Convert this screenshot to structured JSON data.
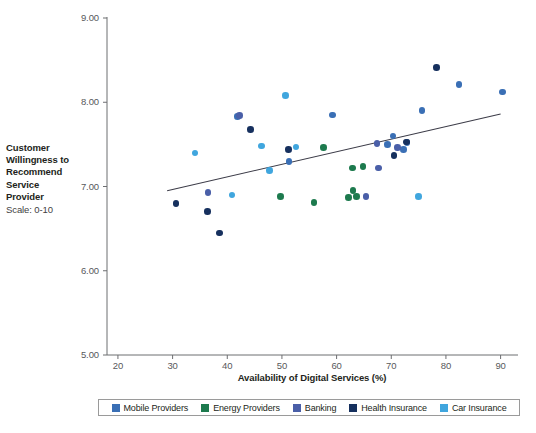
{
  "chart_data": {
    "type": "scatter",
    "title": "",
    "xlabel": "Availability of Digital Services (%)",
    "ylabel": "Customer Willingness to Recommend Service Provider",
    "ylabel_sub": "Scale: 0-10",
    "xlim": [
      18,
      93
    ],
    "ylim": [
      5.0,
      9.0
    ],
    "xticks": [
      20,
      30,
      40,
      50,
      60,
      70,
      80,
      90
    ],
    "xtick_labels": [
      "20",
      "30",
      "40",
      "50",
      "60",
      "70",
      "80",
      "90"
    ],
    "yticks": [
      5.0,
      6.0,
      7.0,
      8.0,
      9.0
    ],
    "ytick_labels": [
      "5.00",
      "6.00",
      "7.00",
      "8.00",
      "9.00"
    ],
    "grid": false,
    "legend_position": "bottom",
    "trendline": {
      "x0": 29.0,
      "y0": 6.95,
      "x1": 90.0,
      "y1": 7.86,
      "color": "#3c3c48"
    },
    "series": [
      {
        "name": "Mobile Providers",
        "color": "#3a6fb5",
        "points": [
          [
            41.9,
            7.83
          ],
          [
            51.3,
            7.3
          ],
          [
            59.3,
            7.85
          ],
          [
            69.3,
            7.5
          ],
          [
            70.3,
            7.6
          ],
          [
            72.2,
            7.44
          ],
          [
            72.9,
            7.52
          ],
          [
            75.6,
            7.9
          ],
          [
            82.4,
            8.21
          ],
          [
            90.3,
            8.12
          ]
        ]
      },
      {
        "name": "Energy Providers",
        "color": "#1d7a4e",
        "points": [
          [
            49.7,
            6.88
          ],
          [
            55.9,
            6.81
          ],
          [
            57.6,
            7.46
          ],
          [
            62.2,
            6.87
          ],
          [
            62.9,
            7.22
          ],
          [
            63.0,
            6.95
          ],
          [
            63.6,
            6.88
          ],
          [
            64.8,
            7.24
          ]
        ]
      },
      {
        "name": "Banking",
        "color": "#4a5fa8",
        "points": [
          [
            36.5,
            6.93
          ],
          [
            42.2,
            7.84
          ],
          [
            65.4,
            6.88
          ],
          [
            67.4,
            7.51
          ],
          [
            67.7,
            7.22
          ],
          [
            71.1,
            7.46
          ]
        ]
      },
      {
        "name": "Health Insurance",
        "color": "#16305e",
        "points": [
          [
            30.6,
            6.8
          ],
          [
            36.4,
            6.7
          ],
          [
            38.6,
            6.45
          ],
          [
            44.2,
            7.68
          ],
          [
            51.2,
            7.44
          ],
          [
            70.5,
            7.37
          ],
          [
            72.8,
            7.53
          ],
          [
            78.3,
            8.41
          ]
        ]
      },
      {
        "name": "Car Insurance",
        "color": "#40a6de",
        "points": [
          [
            34.1,
            7.4
          ],
          [
            40.9,
            6.9
          ],
          [
            46.3,
            7.48
          ],
          [
            47.7,
            7.19
          ],
          [
            50.6,
            8.08
          ],
          [
            52.6,
            7.47
          ],
          [
            75.0,
            6.88
          ]
        ]
      }
    ]
  },
  "axes": {
    "plot_left": 107,
    "plot_right": 517,
    "plot_top": 18,
    "plot_bottom": 355
  },
  "legend": {
    "items": [
      {
        "label": "Mobile Providers",
        "color": "#3a6fb5"
      },
      {
        "label": "Energy Providers",
        "color": "#1d7a4e"
      },
      {
        "label": "Banking",
        "color": "#4a5fa8"
      },
      {
        "label": "Health Insurance",
        "color": "#16305e"
      },
      {
        "label": "Car Insurance",
        "color": "#40a6de"
      }
    ]
  }
}
